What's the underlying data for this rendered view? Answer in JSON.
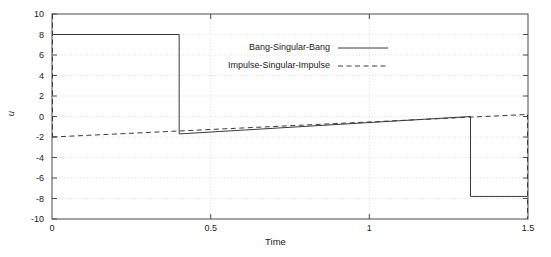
{
  "chart_data": {
    "type": "line",
    "title": "",
    "xlabel": "Time",
    "ylabel": "u",
    "xlim": [
      0,
      1.5
    ],
    "ylim": [
      -10,
      10
    ],
    "xticks": [
      "0",
      "0.5",
      "1",
      "1.5"
    ],
    "xtick_values": [
      0,
      0.5,
      1,
      1.5
    ],
    "yticks": [
      "-10",
      "-8",
      "-6",
      "-4",
      "-2",
      "0",
      "2",
      "4",
      "6",
      "8",
      "10"
    ],
    "ytick_values": [
      -10,
      -8,
      -6,
      -4,
      -2,
      0,
      2,
      4,
      6,
      8,
      10
    ],
    "grid": true,
    "grid_style": "dotted",
    "legend_position": "upper-center",
    "series": [
      {
        "name": "Bang-Singular-Bang",
        "style": "solid",
        "color": "#3a3a3a",
        "points": [
          [
            0.0,
            8.0
          ],
          [
            0.4,
            8.0
          ],
          [
            0.4,
            -1.7
          ],
          [
            1.32,
            0.0
          ],
          [
            1.32,
            -7.8
          ],
          [
            1.5,
            -7.8
          ]
        ]
      },
      {
        "name": "Impulse-Singular-Impulse",
        "style": "dashed",
        "color": "#3a3a3a",
        "points": [
          [
            0.0,
            10.0
          ],
          [
            0.0,
            -2.0
          ],
          [
            1.5,
            0.2
          ],
          [
            1.5,
            -10.0
          ]
        ]
      }
    ],
    "legend": [
      {
        "label": "Bang-Singular-Bang",
        "style": "solid"
      },
      {
        "label": "Impulse-Singular-Impulse",
        "style": "dashed"
      }
    ]
  },
  "axes": {
    "y_tick_0": "10",
    "y_tick_1": "8",
    "y_tick_2": "6",
    "y_tick_3": "4",
    "y_tick_4": "2",
    "y_tick_5": "0",
    "y_tick_6": "-2",
    "y_tick_7": "-4",
    "y_tick_8": "-6",
    "y_tick_9": "-8",
    "y_tick_10": "-10",
    "x_tick_0": "0",
    "x_tick_1": "0.5",
    "x_tick_2": "1",
    "x_tick_3": "1.5",
    "x_axis_label": "Time",
    "y_axis_label": "u"
  },
  "legend": {
    "entry_0": "Bang-Singular-Bang",
    "entry_1": "Impulse-Singular-Impulse"
  }
}
